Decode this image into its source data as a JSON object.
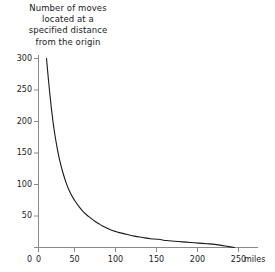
{
  "chart_data": {
    "type": "line",
    "title": "Number of moves located at a specified distance from the origin",
    "title_lines": [
      "Number of moves",
      "located at a",
      "specified distance",
      "from the origin"
    ],
    "xlabel": "miles",
    "ylabel": "",
    "xlim": [
      0,
      255
    ],
    "ylim": [
      0,
      315
    ],
    "grid": false,
    "legend": null,
    "line_color": "#1a1a1a",
    "axis_color": "#8a8a8a",
    "x_ticks": [
      0,
      50,
      100,
      150,
      200,
      250
    ],
    "x_tick_labels": [
      "0",
      "50",
      "100",
      "150",
      "200",
      "250"
    ],
    "y_ticks": [
      0,
      50,
      100,
      150,
      200,
      250,
      300
    ],
    "y_tick_labels": [
      "0",
      "50",
      "100",
      "150",
      "200",
      "250",
      "300"
    ],
    "x_axis_unit_label": "miles",
    "x": [
      10,
      12,
      14,
      16,
      18,
      20,
      23,
      26,
      30,
      35,
      40,
      45,
      50,
      55,
      60,
      65,
      70,
      75,
      80,
      85,
      90,
      95,
      100,
      110,
      120,
      130,
      140,
      150,
      160,
      170,
      180,
      190,
      200,
      210,
      220,
      230,
      240,
      245
    ],
    "values": [
      300,
      272,
      246,
      222,
      201,
      183,
      160,
      141,
      121,
      101,
      86,
      75,
      66,
      58,
      52,
      47,
      42,
      38,
      34,
      31,
      28,
      26,
      24,
      21,
      18,
      16,
      14,
      13,
      11,
      10,
      9,
      8,
      7,
      6,
      5,
      3,
      1,
      0
    ],
    "series": [
      {
        "name": "Number of moves",
        "x": [
          10,
          12,
          14,
          16,
          18,
          20,
          23,
          26,
          30,
          35,
          40,
          45,
          50,
          55,
          60,
          65,
          70,
          75,
          80,
          85,
          90,
          95,
          100,
          110,
          120,
          130,
          140,
          150,
          160,
          170,
          180,
          190,
          200,
          210,
          220,
          230,
          240,
          245
        ],
        "values": [
          300,
          272,
          246,
          222,
          201,
          183,
          160,
          141,
          121,
          101,
          86,
          75,
          66,
          58,
          52,
          47,
          42,
          38,
          34,
          31,
          28,
          26,
          24,
          21,
          18,
          16,
          14,
          13,
          11,
          10,
          9,
          8,
          7,
          6,
          5,
          3,
          1,
          0
        ]
      }
    ]
  }
}
